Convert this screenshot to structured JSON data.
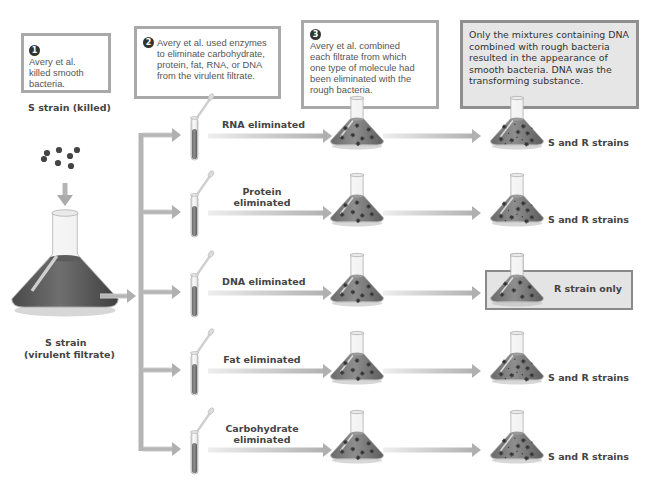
{
  "steps": [
    {
      "number": "1",
      "text": "Avery et al. killed smooth bacteria."
    },
    {
      "number": "2",
      "text": "Avery et al. used enzymes to eliminate carbohydrate, protein, fat, RNA, or DNA from the virulent filtrate."
    },
    {
      "number": "3",
      "text": "Avery et al. combined each filtrate from which one type of molecule had been eliminated with the rough bacteria."
    }
  ],
  "conclusion": "Only the mixtures containing DNA combined with rough bacteria resulted in the appearance of smooth bacteria. DNA was the transforming substance.",
  "source": {
    "killed_label": "S strain (killed)",
    "filtrate_label_line1": "S strain",
    "filtrate_label_line2": "(virulent filtrate)"
  },
  "rows": [
    {
      "treatment_line1": "RNA eliminated",
      "treatment_line2": "",
      "result": "S and R strains",
      "highlighted": false
    },
    {
      "treatment_line1": "Protein",
      "treatment_line2": "eliminated",
      "result": "S and R strains",
      "highlighted": false
    },
    {
      "treatment_line1": "DNA eliminated",
      "treatment_line2": "",
      "result": "R strain only",
      "highlighted": true
    },
    {
      "treatment_line1": "Fat eliminated",
      "treatment_line2": "",
      "result": "S and R strains",
      "highlighted": false
    },
    {
      "treatment_line1": "Carbohydrate",
      "treatment_line2": "eliminated",
      "result": "S and R strains",
      "highlighted": false
    }
  ],
  "colors": {
    "arrow": "#b5b5b5",
    "liquid": "#7a7a7a",
    "liquid_dark": "#5a5a5a",
    "bacteria": "#3a3a3a",
    "box_border": "#a9a9a9",
    "conclusion_fill": "#e6e6e6"
  }
}
